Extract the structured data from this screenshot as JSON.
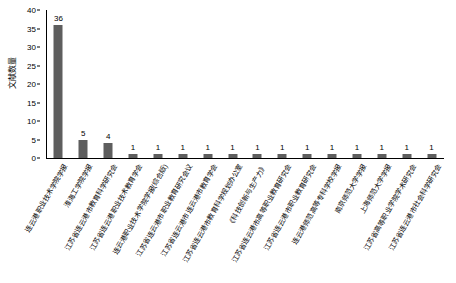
{
  "chart_data": {
    "type": "bar",
    "title": "",
    "xlabel": "",
    "ylabel": "文献数量",
    "ylim": [
      0,
      40
    ],
    "yticks": [
      0,
      5,
      10,
      15,
      20,
      25,
      30,
      35,
      40
    ],
    "grid": false,
    "legend": false,
    "bar_color": "#5e5e5e",
    "categories": [
      "连云港职业技术学院学报",
      "淮海工学院学报",
      "江苏省连云港市教育科学研究会",
      "江苏省连云港职业技术教育学会",
      "连云港职业技术学院学报(综合版)",
      "江苏省连云港市职业教育研究会议",
      "江苏省连云港市连云港市教育学会",
      "江苏省连云港市教育科学规划办公室",
      "《科技创新与生产力》",
      "江苏省连云港市高等职业教育研究会",
      "江苏省连云港市职业教育研究会",
      "连云港师范高等专科学校学报",
      "南京师范大学学报",
      "上海师范大学学报",
      "江苏省高等职业学院学术研究会",
      "江苏省连云港市社会科学研究会"
    ],
    "values": [
      36,
      5,
      4,
      1,
      1,
      1,
      1,
      1,
      1,
      1,
      1,
      1,
      1,
      1,
      1,
      1
    ],
    "value_labels": [
      "36",
      "5",
      "4",
      "1",
      "1",
      "1",
      "1",
      "1",
      "1",
      "1",
      "1",
      "1",
      "1",
      "1",
      "1",
      "1"
    ]
  }
}
